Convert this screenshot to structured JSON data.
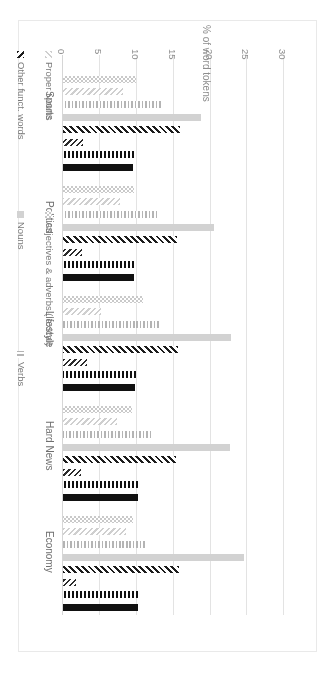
{
  "chart_data": {
    "type": "bar",
    "title": "",
    "subtitle": "",
    "orientation": "vertical-grouped",
    "xlabel": "",
    "ylabel": "% of word tokens",
    "ylim": [
      0,
      30
    ],
    "yticks": [
      0,
      5,
      10,
      15,
      20,
      25,
      30
    ],
    "ytick_labels": [
      "0",
      "5",
      "10",
      "15",
      "20",
      "25",
      "30"
    ],
    "grid": true,
    "legend_position": "bottom",
    "categories": [
      "Economy",
      "Hard News",
      "Lifestyle",
      "Politics",
      "Sports"
    ],
    "series": [
      {
        "name": "Prepositions",
        "values": [
          10.2,
          10.1,
          9.8,
          9.6,
          9.5
        ],
        "color": "#111111",
        "pattern": "solid-dark"
      },
      {
        "name": "Determiners",
        "values": [
          10.1,
          10.2,
          9.9,
          9.6,
          9.6
        ],
        "color": "#111111",
        "pattern": "vertical-lines-dark"
      },
      {
        "name": "Pronouns",
        "values": [
          1.7,
          2.4,
          3.2,
          2.6,
          2.7
        ],
        "color": "#2b2b2b",
        "pattern": "diagonal-fine-dark"
      },
      {
        "name": "Other funct. words",
        "values": [
          15.7,
          15.3,
          15.6,
          15.4,
          15.8
        ],
        "color": "#1c1c1c",
        "pattern": "diagonal-hatch-dark"
      },
      {
        "name": "Nouns",
        "values": [
          24.5,
          22.6,
          22.8,
          20.4,
          18.7
        ],
        "color": "#d2d2d2",
        "pattern": "solid-light"
      },
      {
        "name": "Verbs",
        "values": [
          11.1,
          11.9,
          13.0,
          12.7,
          13.3
        ],
        "color": "#b4b4b4",
        "pattern": "vertical-lines-light"
      },
      {
        "name": "Proper Nouns",
        "values": [
          8.5,
          7.3,
          5.1,
          7.7,
          8.1
        ],
        "color": "#cfcfcf",
        "pattern": "diagonal-fine-light"
      },
      {
        "name": "Adjectives & adverbs (lexical)",
        "values": [
          9.5,
          9.3,
          10.9,
          9.6,
          9.9
        ],
        "color": "#c9c9c9",
        "pattern": "checker-light"
      }
    ]
  },
  "legend": {
    "items": [
      {
        "label": "Prepositions"
      },
      {
        "label": "Determiners"
      },
      {
        "label": "Pronouns"
      },
      {
        "label": "Other funct. words"
      },
      {
        "label": "Nouns"
      },
      {
        "label": "Verbs"
      },
      {
        "label": "Proper Nouns"
      },
      {
        "label": "Adjectives & adverbs (lexical)"
      }
    ]
  },
  "axis": {
    "title": "% of word tokens",
    "ticks": [
      "30",
      "25",
      "20",
      "15",
      "10",
      "5",
      "0"
    ]
  },
  "categories": {
    "labels": [
      "Economy",
      "Hard News",
      "Lifestyle",
      "Politics",
      "Sports"
    ]
  }
}
